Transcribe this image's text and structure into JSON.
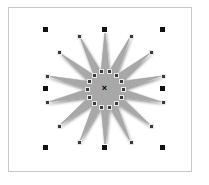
{
  "document": {
    "title": "Star Shape Selection",
    "background_color": "#ffffff",
    "frame_border_color": "#c9c9c9",
    "frame": {
      "x": 8,
      "y": 7,
      "width": 184,
      "height": 165
    }
  },
  "shape": {
    "name": "star-polygon",
    "type": "star",
    "points": 14,
    "fill_color": "#a8a8a8",
    "stroke_color": "#9a9a9a",
    "shadow_color": "#bdbdbd",
    "center": {
      "x": 105,
      "y": 89
    },
    "outer_radius": 59,
    "inner_radius": 18,
    "rotation_deg": 0
  },
  "selection": {
    "state_label": "selected",
    "bounds": {
      "left": 46,
      "top": 30,
      "right": 163,
      "bottom": 148
    },
    "handle_color": "#111111",
    "handle_outline_color": "#ffffff",
    "handle_size": 7,
    "handles": [
      {
        "name": "handle-top-left",
        "x": 46,
        "y": 30,
        "cursor": "nwse-resize"
      },
      {
        "name": "handle-top-center",
        "x": 105,
        "y": 30,
        "cursor": "ns-resize"
      },
      {
        "name": "handle-top-right",
        "x": 163,
        "y": 30,
        "cursor": "nesw-resize"
      },
      {
        "name": "handle-middle-left",
        "x": 46,
        "y": 89,
        "cursor": "ew-resize"
      },
      {
        "name": "handle-middle-right",
        "x": 163,
        "y": 89,
        "cursor": "ew-resize"
      },
      {
        "name": "handle-bottom-left",
        "x": 46,
        "y": 148,
        "cursor": "nesw-resize"
      },
      {
        "name": "handle-bottom-center",
        "x": 105,
        "y": 148,
        "cursor": "ns-resize"
      },
      {
        "name": "handle-bottom-right",
        "x": 163,
        "y": 148,
        "cursor": "nwse-resize"
      }
    ]
  },
  "rotation_center": {
    "name": "rotation-center-marker",
    "glyph": "×",
    "x": 105,
    "y": 89,
    "color": "#000000"
  },
  "node_handles": {
    "color": "#3a3a3a",
    "size": 3,
    "outer_count": 14,
    "inner_count": 14
  }
}
